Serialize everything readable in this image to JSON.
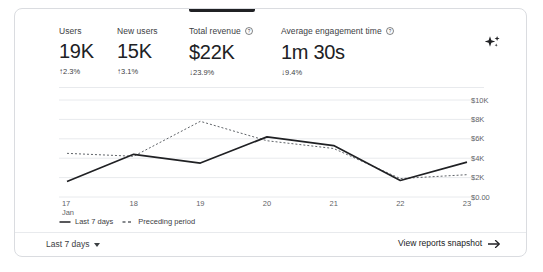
{
  "metrics": [
    {
      "label": "Users",
      "value": "19K",
      "delta": "2.3%",
      "direction": "up",
      "arrow": "↑",
      "has_help": false,
      "active": false
    },
    {
      "label": "New users",
      "value": "15K",
      "delta": "3.1%",
      "direction": "up",
      "arrow": "↑",
      "has_help": false,
      "active": false
    },
    {
      "label": "Total revenue",
      "value": "$22K",
      "delta": "23.9%",
      "direction": "down",
      "arrow": "↓",
      "has_help": true,
      "active": true
    },
    {
      "label": "Average engagement time",
      "value": "1m 30s",
      "delta": "9.4%",
      "direction": "down",
      "arrow": "↓",
      "has_help": true,
      "active": false
    }
  ],
  "icons": {
    "sparkle": "sparkle-icon",
    "help": "help-circle-icon",
    "caret": "chevron-down-icon",
    "arrow_right": "arrow-right-icon"
  },
  "chart_data": {
    "type": "line",
    "title": "",
    "xlabel": "",
    "ylabel": "",
    "x": [
      "17",
      "18",
      "19",
      "20",
      "21",
      "22",
      "23"
    ],
    "x_sublabel_first": "Jan",
    "categories": [
      "17 Jan",
      "18",
      "19",
      "20",
      "21",
      "22",
      "23"
    ],
    "ytick_labels": [
      "$10K",
      "$8K",
      "$6K",
      "$4K",
      "$2K",
      "$0.00"
    ],
    "ytick_values": [
      10000,
      8000,
      6000,
      4000,
      2000,
      0
    ],
    "ylim": [
      0,
      10000
    ],
    "grid": true,
    "legend_position": "bottom-left",
    "series": [
      {
        "name": "Last 7 days",
        "style": "solid",
        "color": "#202124",
        "values": [
          1600,
          4400,
          3500,
          6200,
          5300,
          1700,
          3600
        ]
      },
      {
        "name": "Preceding period",
        "style": "dashed",
        "color": "#5f6368",
        "values": [
          4500,
          4200,
          7800,
          5800,
          5000,
          1900,
          2300
        ]
      }
    ]
  },
  "footer": {
    "date_range_label": "Last 7 days",
    "snapshot_label": "View reports snapshot"
  },
  "colors": {
    "card_border": "#dadce0",
    "grid": "#e8eaed",
    "text_primary": "#202124",
    "text_secondary": "#5f6368",
    "series_primary": "#202124",
    "series_secondary": "#5f6368"
  }
}
